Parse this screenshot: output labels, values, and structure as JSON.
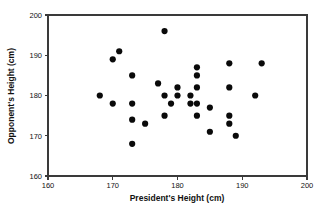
{
  "chart_data": {
    "type": "scatter",
    "title": "",
    "xlabel": "President's Height (cm)",
    "ylabel": "Opponent's Height (cm)",
    "xlim": [
      160,
      200
    ],
    "ylim": [
      160,
      200
    ],
    "xticks": [
      160,
      170,
      180,
      190,
      200
    ],
    "yticks": [
      160,
      170,
      180,
      190,
      200
    ],
    "grid": false,
    "legend": null,
    "marker": {
      "shape": "circle",
      "color": "#0a0a0a",
      "size_px": 3.1
    },
    "series": [
      {
        "name": "President vs Opponent heights",
        "points": [
          [
            168,
            180
          ],
          [
            170,
            189
          ],
          [
            170,
            178
          ],
          [
            171,
            191
          ],
          [
            173,
            185
          ],
          [
            173,
            178
          ],
          [
            173,
            174
          ],
          [
            173,
            168
          ],
          [
            175,
            173
          ],
          [
            177,
            183
          ],
          [
            178,
            196
          ],
          [
            178,
            180
          ],
          [
            178,
            175
          ],
          [
            179,
            178
          ],
          [
            180,
            182
          ],
          [
            180,
            180
          ],
          [
            182,
            180
          ],
          [
            182,
            178
          ],
          [
            183,
            187
          ],
          [
            183,
            185
          ],
          [
            183,
            182
          ],
          [
            183,
            178
          ],
          [
            183,
            175
          ],
          [
            185,
            177
          ],
          [
            185,
            171
          ],
          [
            188,
            188
          ],
          [
            188,
            182
          ],
          [
            188,
            175
          ],
          [
            188,
            173
          ],
          [
            189,
            170
          ],
          [
            192,
            180
          ],
          [
            193,
            188
          ]
        ]
      }
    ],
    "n_points": 32
  },
  "axes": {
    "x_tick_labels": [
      "160",
      "170",
      "180",
      "190",
      "200"
    ],
    "y_tick_labels": [
      "160",
      "170",
      "180",
      "190",
      "200"
    ],
    "x_axis_title": "President's Height (cm)",
    "y_axis_title": "Opponent's Height (cm)"
  }
}
